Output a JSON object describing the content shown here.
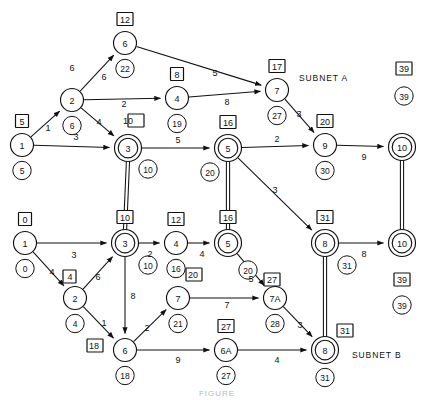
{
  "figure": {
    "title_partial": "FIGURE",
    "subnet_a_label": "SUBNET A",
    "subnet_b_label": "SUBNET B"
  },
  "chart_data": {
    "type": "diagram",
    "diagram_kind": "activity-on-node / PERT network with two subnets",
    "legend": {
      "square_box": "early value (boxed number above node)",
      "small_circle": "late / cumulative value (circled number below node)",
      "edge_number": "arc duration / cost",
      "double_circle_node": "interface / shared node between subnets",
      "double_line": "vertical linkage between identical interface nodes"
    },
    "subnets": [
      {
        "name": "SUBNET A",
        "nodes": [
          {
            "id": "A1",
            "label": "1",
            "x": 22,
            "y": 145,
            "double": false,
            "box": "5",
            "circle": "5"
          },
          {
            "id": "A2",
            "label": "2",
            "x": 72,
            "y": 100,
            "double": false,
            "box": null,
            "circle": "6"
          },
          {
            "id": "A6",
            "label": "6",
            "x": 125,
            "y": 43,
            "double": false,
            "box": "12",
            "circle": "22"
          },
          {
            "id": "A3",
            "label": "3",
            "x": 128,
            "y": 148,
            "double": true,
            "box": "10",
            "circle": "10"
          },
          {
            "id": "A4",
            "label": "4",
            "x": 177,
            "y": 98,
            "double": false,
            "box": "8",
            "circle": "19"
          },
          {
            "id": "A5",
            "label": "5",
            "x": 228,
            "y": 148,
            "double": true,
            "box": "16",
            "circle": "20"
          },
          {
            "id": "A7",
            "label": "7",
            "x": 277,
            "y": 90,
            "double": false,
            "box": "17",
            "circle": "27"
          },
          {
            "id": "A9",
            "label": "9",
            "x": 325,
            "y": 145,
            "double": false,
            "box": "20",
            "circle": "30"
          },
          {
            "id": "A10",
            "label": "10",
            "x": 402,
            "y": 147,
            "double": true,
            "box": "39",
            "circle": "39"
          }
        ],
        "edges": [
          {
            "from": "A1",
            "to": "A2",
            "label": "1",
            "lx": 48,
            "ly": 128
          },
          {
            "from": "A1",
            "to": "A3",
            "label": "3",
            "lx": 76,
            "ly": 137
          },
          {
            "from": "A2",
            "to": "A6",
            "label": "6",
            "lx": 104,
            "ly": 77
          },
          {
            "from": "A2",
            "to": "A6",
            "label": "6",
            "lx": 72,
            "ly": 68,
            "label_only": true
          },
          {
            "from": "A2",
            "to": "A4",
            "label": "2",
            "lx": 124,
            "ly": 104
          },
          {
            "from": "A2",
            "to": "A3",
            "label": "4",
            "lx": 99,
            "ly": 122
          },
          {
            "from": "A6",
            "to": "A7",
            "label": "5",
            "lx": 215,
            "ly": 73
          },
          {
            "from": "A4",
            "to": "A7",
            "label": "8",
            "lx": 227,
            "ly": 102
          },
          {
            "from": "A3",
            "to": "A5",
            "label": "5",
            "lx": 178,
            "ly": 140
          },
          {
            "from": "A5",
            "to": "A9",
            "label": "2",
            "lx": 277,
            "ly": 139
          },
          {
            "from": "A7",
            "to": "A9",
            "label": "3",
            "lx": 299,
            "ly": 114
          },
          {
            "from": "A9",
            "to": "A10",
            "label": "9",
            "lx": 364,
            "ly": 157
          },
          {
            "from": "A5",
            "to": "B8",
            "label": "3",
            "lx": 275,
            "ly": 190
          }
        ]
      },
      {
        "name": "SUBNET B",
        "nodes": [
          {
            "id": "B1",
            "label": "1",
            "x": 25,
            "y": 243,
            "double": false,
            "box": "0",
            "circle": "0"
          },
          {
            "id": "B2",
            "label": "2",
            "x": 75,
            "y": 298,
            "double": false,
            "box": "4",
            "circle": "4"
          },
          {
            "id": "B3",
            "label": "3",
            "x": 125,
            "y": 243,
            "double": true,
            "box": "10",
            "circle": "10"
          },
          {
            "id": "B4",
            "label": "4",
            "x": 176,
            "y": 243,
            "double": false,
            "box": "12",
            "circle": "16"
          },
          {
            "id": "B5",
            "label": "5",
            "x": 228,
            "y": 243,
            "double": true,
            "box": "16",
            "circle": "20"
          },
          {
            "id": "B6",
            "label": "6",
            "x": 125,
            "y": 350,
            "double": false,
            "box": "18",
            "circle": "18"
          },
          {
            "id": "B7",
            "label": "7",
            "x": 178,
            "y": 298,
            "double": false,
            "box": "20",
            "circle": "21"
          },
          {
            "id": "B7A",
            "label": "7A",
            "x": 275,
            "y": 298,
            "double": false,
            "box": "27",
            "circle": "28"
          },
          {
            "id": "B6A",
            "label": "6A",
            "x": 226,
            "y": 350,
            "double": false,
            "box": "27",
            "circle": "27"
          },
          {
            "id": "B8",
            "label": "8",
            "x": 325,
            "y": 243,
            "double": true,
            "box": "31",
            "circle": "31"
          },
          {
            "id": "B8b",
            "label": "8",
            "x": 325,
            "y": 350,
            "double": true,
            "box": "31",
            "circle": "31"
          },
          {
            "id": "B10",
            "label": "10",
            "x": 402,
            "y": 243,
            "double": true,
            "box": "39",
            "circle": "39"
          }
        ],
        "edges": [
          {
            "from": "B1",
            "to": "B3",
            "label": "3",
            "lx": 74,
            "ly": 255
          },
          {
            "from": "B1",
            "to": "B2",
            "label": "4",
            "lx": 52,
            "ly": 272
          },
          {
            "from": "B2",
            "to": "B3",
            "label": "6",
            "lx": 98,
            "ly": 277
          },
          {
            "from": "B2",
            "to": "B6",
            "label": "1",
            "lx": 104,
            "ly": 323
          },
          {
            "from": "B3",
            "to": "B6",
            "label": "8",
            "lx": 133,
            "ly": 296
          },
          {
            "from": "B3",
            "to": "B4",
            "label": "2",
            "lx": 150,
            "ly": 254
          },
          {
            "from": "B4",
            "to": "B5",
            "label": "4",
            "lx": 202,
            "ly": 254
          },
          {
            "from": "B6",
            "to": "B7",
            "label": "2",
            "lx": 147,
            "ly": 328
          },
          {
            "from": "B7",
            "to": "B7A",
            "label": "7",
            "lx": 227,
            "ly": 305
          },
          {
            "from": "B5",
            "to": "B7A",
            "label": "5",
            "lx": 251,
            "ly": 279
          },
          {
            "from": "B6",
            "to": "B6A",
            "label": "9",
            "lx": 178,
            "ly": 360
          },
          {
            "from": "B6A",
            "to": "B8b",
            "label": "4",
            "lx": 277,
            "ly": 360
          },
          {
            "from": "B7A",
            "to": "B8b",
            "label": "3",
            "lx": 300,
            "ly": 325
          },
          {
            "from": "B8",
            "to": "B10",
            "label": "8",
            "lx": 364,
            "ly": 254
          }
        ]
      }
    ],
    "interface_links": [
      {
        "from": "A3",
        "to": "B3",
        "style": "double-line"
      },
      {
        "from": "A5",
        "to": "B5",
        "style": "double-line"
      },
      {
        "from": "A10",
        "to": "B10",
        "style": "double-line"
      },
      {
        "from": "B8",
        "to": "B8b",
        "style": "double-line"
      }
    ]
  }
}
